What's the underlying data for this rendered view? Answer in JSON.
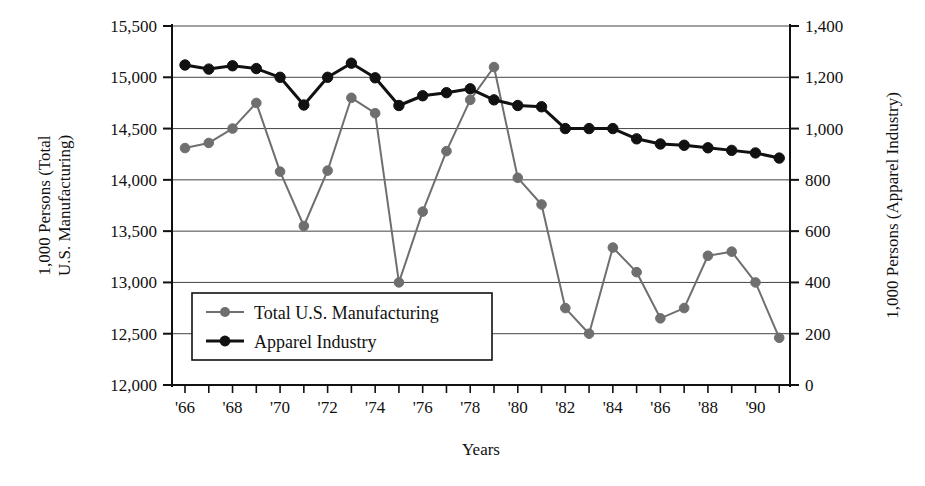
{
  "chart_data": {
    "type": "line",
    "title": "",
    "xlabel": "Years",
    "ylabel_left": "1,000 Persons (Total U.S. Manufacturing)",
    "ylabel_left_line1": "1,000 Persons (Total",
    "ylabel_left_line2": "U.S. Manufacturing)",
    "ylabel_right": "1,000 Persons (Apparel Industry)",
    "grid": true,
    "legend_position": "inside-lower-left",
    "x": [
      1966,
      1967,
      1968,
      1969,
      1970,
      1971,
      1972,
      1973,
      1974,
      1975,
      1976,
      1977,
      1978,
      1979,
      1980,
      1981,
      1982,
      1983,
      1984,
      1985,
      1986,
      1987,
      1988,
      1989,
      1990,
      1991
    ],
    "xtick_positions": [
      1966,
      1967,
      1968,
      1969,
      1970,
      1971,
      1972,
      1973,
      1974,
      1975,
      1976,
      1977,
      1978,
      1979,
      1980,
      1981,
      1982,
      1983,
      1984,
      1985,
      1986,
      1987,
      1988,
      1989,
      1990,
      1991
    ],
    "xtick_labels": [
      "'66",
      "",
      "'68",
      "",
      "'70",
      "",
      "'72",
      "",
      "'74",
      "",
      "'76",
      "",
      "'78",
      "",
      "'80",
      "",
      "'82",
      "",
      "'84",
      "",
      "'86",
      "",
      "'88",
      "",
      "'90",
      ""
    ],
    "ylim_left": [
      12000,
      15500
    ],
    "ytick_labels_left": [
      "15,500",
      "15,000",
      "14,500",
      "14,000",
      "13,500",
      "13,000",
      "12,500",
      "12,000"
    ],
    "ytick_values_left": [
      15500,
      15000,
      14500,
      14000,
      13500,
      13000,
      12500,
      12000
    ],
    "ylim_right": [
      0,
      1400
    ],
    "ytick_labels_right": [
      "1,400",
      "1,200",
      "1,000",
      "800",
      "600",
      "400",
      "200",
      "0"
    ],
    "ytick_values_right": [
      1400,
      1200,
      1000,
      800,
      600,
      400,
      200,
      0
    ],
    "series": [
      {
        "name": "Total U.S. Manufacturing",
        "axis": "left",
        "color": "#6f6f6f",
        "marker": "circle",
        "values": [
          14310,
          14360,
          14500,
          14750,
          14080,
          13550,
          14090,
          14800,
          14650,
          13000,
          13690,
          14280,
          14780,
          15100,
          14020,
          13760,
          12750,
          12500,
          13340,
          13100,
          12650,
          12750,
          13260,
          13300,
          13000,
          12460
        ]
      },
      {
        "name": "Apparel Industry",
        "axis": "right",
        "color": "#111111",
        "marker": "circle",
        "values": [
          1248,
          1232,
          1245,
          1234,
          1200,
          1092,
          1200,
          1255,
          1198,
          1090,
          1128,
          1140,
          1155,
          1112,
          1090,
          1085,
          1000,
          1000,
          1000,
          960,
          940,
          935,
          925,
          915,
          905,
          885
        ]
      }
    ]
  },
  "legend": {
    "items": [
      {
        "label": "Total U.S. Manufacturing",
        "color": "#6f6f6f"
      },
      {
        "label": "Apparel Industry",
        "color": "#111111"
      }
    ]
  }
}
